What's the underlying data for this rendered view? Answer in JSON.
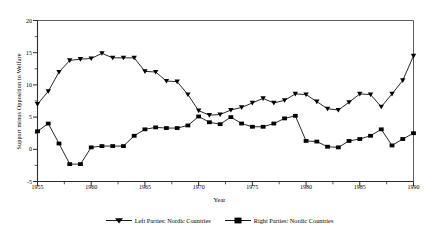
{
  "chart_data": {
    "type": "line",
    "title": "",
    "xlabel": "Year",
    "ylabel": "Support minus Opposition to Welfare",
    "xlim": [
      1955,
      1990
    ],
    "ylim": [
      -5,
      20
    ],
    "ytick_labels": [
      "20",
      "15",
      "10",
      "5",
      "0",
      "-5"
    ],
    "ytick_values": [
      20,
      15,
      10,
      5,
      0,
      -5
    ],
    "yminor_values": [
      17.5,
      12.5,
      7.5,
      2.5,
      -2.5
    ],
    "xtick_labels": [
      "1955",
      "1960",
      "1965",
      "1970",
      "1975",
      "1980",
      "1985",
      "1990"
    ],
    "xtick_values": [
      1955,
      1960,
      1965,
      1970,
      1975,
      1980,
      1985,
      1990
    ],
    "xminor_values": [
      1957.5,
      1962.5,
      1967.5,
      1972.5,
      1977.5,
      1982.5,
      1987.5
    ],
    "grid": false,
    "legend_position": "bottom",
    "line_color": "#000000",
    "x": [
      1955,
      1956,
      1957,
      1958,
      1959,
      1960,
      1961,
      1962,
      1963,
      1964,
      1965,
      1966,
      1967,
      1968,
      1969,
      1970,
      1971,
      1972,
      1973,
      1974,
      1975,
      1976,
      1977,
      1978,
      1979,
      1980,
      1981,
      1982,
      1983,
      1984,
      1985,
      1986,
      1987,
      1988,
      1989,
      1990
    ],
    "series": [
      {
        "name": "Left Parties: Nordic Countries",
        "marker": "triangle-down",
        "values": [
          7.0,
          9.0,
          12.0,
          13.8,
          14.0,
          14.1,
          14.9,
          14.2,
          14.2,
          14.2,
          12.1,
          12.0,
          10.6,
          10.5,
          8.5,
          6.0,
          5.3,
          5.4,
          6.1,
          6.5,
          7.2,
          7.9,
          7.2,
          7.6,
          8.6,
          8.5,
          7.4,
          6.3,
          6.1,
          7.3,
          8.6,
          8.5,
          6.6,
          8.6,
          10.7,
          14.5
        ]
      },
      {
        "name": "Right Parties: Nordic Countries",
        "marker": "square",
        "values": [
          2.8,
          4.0,
          0.9,
          -2.3,
          -2.3,
          0.3,
          0.5,
          0.5,
          0.5,
          2.1,
          3.1,
          3.4,
          3.3,
          3.3,
          3.7,
          5.1,
          4.2,
          3.9,
          5.0,
          4.0,
          3.5,
          3.5,
          4.0,
          4.8,
          5.2,
          1.3,
          1.2,
          0.4,
          0.3,
          1.3,
          1.6,
          2.1,
          3.1,
          0.6,
          1.6,
          2.5
        ]
      }
    ]
  },
  "legend": {
    "entries": [
      {
        "label": "Left Parties: Nordic Countries",
        "marker": "triangle-down-marker-icon"
      },
      {
        "label": "Right Parties: Nordic Countries",
        "marker": "square-marker-icon"
      }
    ]
  }
}
